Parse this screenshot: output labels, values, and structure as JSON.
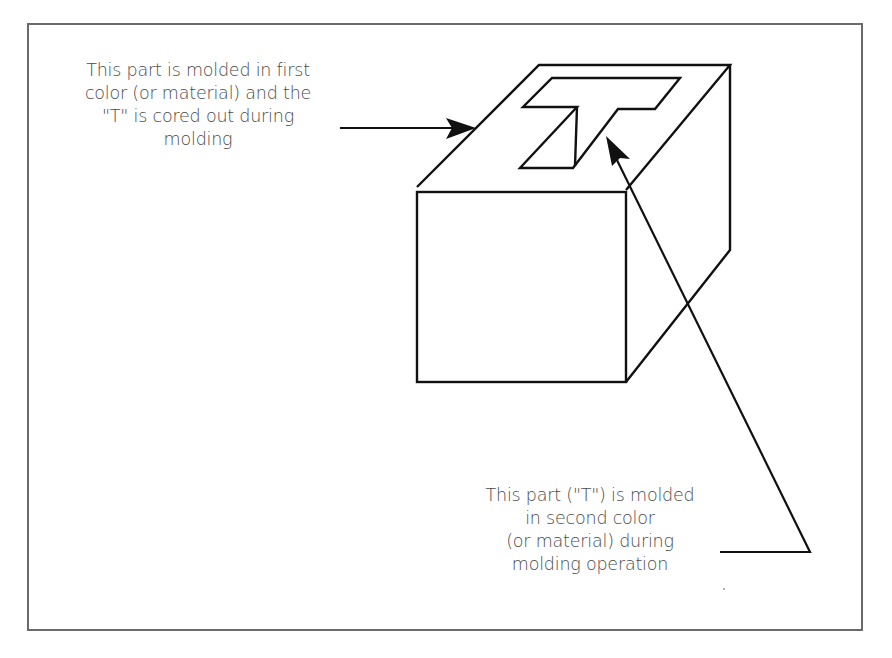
{
  "figure": {
    "frame_color": "#6a6a6a",
    "line_color": "#111111",
    "text_color": "#4a4a4a"
  },
  "callouts": {
    "first_shot": {
      "lines": [
        "This part is molded in first",
        "color (or material) and the",
        "\"T\" is cored out during",
        "molding"
      ]
    },
    "second_shot": {
      "lines": [
        "This part (\"T\") is molded",
        "in second color",
        "(or material) during",
        "molding operation"
      ]
    }
  }
}
